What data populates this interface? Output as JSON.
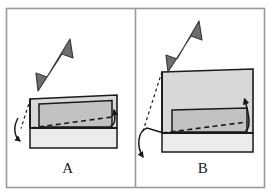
{
  "figure": {
    "title": "",
    "frame": {
      "border_color": "#9a9a9a",
      "background": "#ffffff",
      "divider_color": "#9a9a9a"
    },
    "colors": {
      "outline": "#1a1a1a",
      "arrow_fill": "#6e6e6e",
      "arrow_stroke": "#3c3c3c",
      "face_top_light": "#d8d8d8",
      "face_inner_mid": "#c2c2c2",
      "face_base_pale": "#ececec",
      "dash_color": "#1a1a1a",
      "label_color": "#1a1a1a"
    }
  },
  "panels": [
    {
      "id": "A",
      "label": "A",
      "caption": "",
      "elements": {
        "load_arrow": {
          "name": "thick-load-arrow",
          "direction": "down-left",
          "target": "top-left-vertex"
        },
        "dashed_hinge_line": {
          "name": "dashed-hinge-line",
          "style": "dashed",
          "from": "top-left-vertex",
          "to": "bottom-left-vertex"
        },
        "rotation_arrow": {
          "name": "rotation-curved-arrow",
          "style": "curved",
          "direction": "counter-clockwise-down"
        },
        "diagonal_dashed": {
          "name": "diagonal-dashed-line",
          "style": "dashed",
          "from": "bottom-left-vertex",
          "to": "right-edge"
        },
        "uplift_arrow": {
          "name": "uplift-hook-arrow",
          "direction": "up"
        },
        "body": {
          "name": "deformed-box-body",
          "tilt": "slight"
        }
      }
    },
    {
      "id": "B",
      "label": "B",
      "caption": "",
      "elements": {
        "load_arrow": {
          "name": "thick-load-arrow",
          "direction": "down-left",
          "target": "top-left-vertex"
        },
        "dashed_hinge_line": {
          "name": "dashed-hinge-line",
          "style": "dashed",
          "from": "top-left-vertex",
          "to": "bottom-left-vertex"
        },
        "rotation_arrow": {
          "name": "rotation-curved-arrow",
          "style": "curved",
          "direction": "counter-clockwise-down"
        },
        "diagonal_dashed": {
          "name": "diagonal-dashed-line",
          "style": "dashed",
          "from": "bottom-left-vertex",
          "to": "right-edge"
        },
        "uplift_arrow": {
          "name": "uplift-hook-arrow",
          "direction": "up"
        },
        "body": {
          "name": "deformed-box-body",
          "tilt": "large"
        }
      }
    }
  ]
}
